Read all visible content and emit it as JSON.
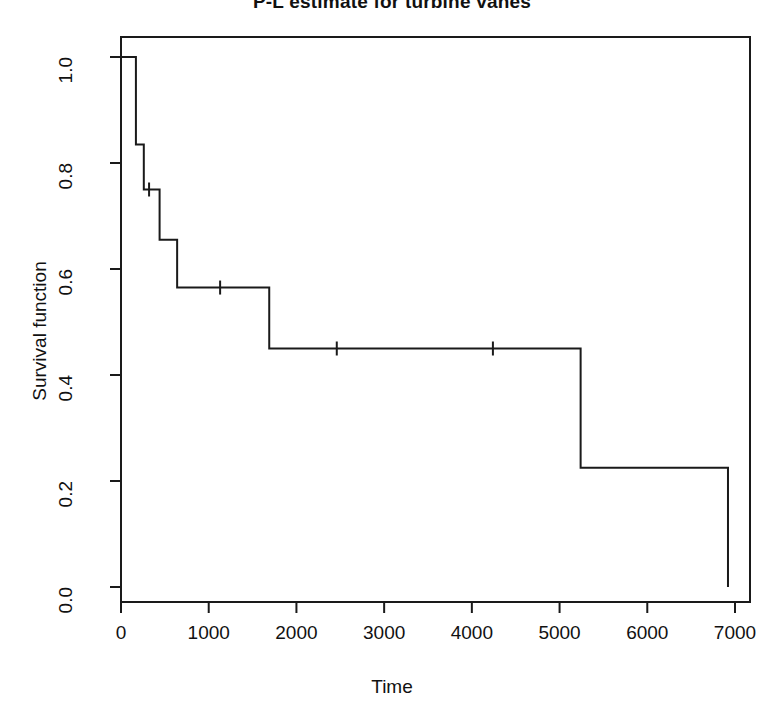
{
  "chart_data": {
    "type": "line",
    "subtype": "kaplan-meier-step",
    "title": "P-L estimate for turbine vanes",
    "xlabel": "Time",
    "ylabel": "Survival function",
    "xlim": [
      0,
      7000
    ],
    "ylim": [
      0.0,
      1.0
    ],
    "xticks": [
      0,
      1000,
      2000,
      3000,
      4000,
      5000,
      6000,
      7000
    ],
    "xticklabels": [
      "0",
      "1000",
      "2000",
      "3000",
      "4000",
      "5000",
      "6000",
      "7000"
    ],
    "yticks": [
      0.0,
      0.2,
      0.4,
      0.6,
      0.8,
      1.0
    ],
    "yticklabels": [
      "0.0",
      "0.2",
      "0.4",
      "0.6",
      "0.8",
      "1.0"
    ],
    "grid": false,
    "legend": null,
    "line_color": "#1a1a1a",
    "background": "#ffffff",
    "series": [
      {
        "name": "Survival function",
        "step": "post",
        "x": [
          0,
          170,
          260,
          440,
          640,
          1690,
          5240,
          6920
        ],
        "y": [
          1.0,
          0.835,
          0.75,
          0.655,
          0.565,
          0.45,
          0.225,
          0.0
        ]
      }
    ],
    "censor_marks": [
      {
        "x": 320,
        "y": 0.75
      },
      {
        "x": 1130,
        "y": 0.565
      },
      {
        "x": 2460,
        "y": 0.45
      },
      {
        "x": 4240,
        "y": 0.45
      }
    ]
  }
}
